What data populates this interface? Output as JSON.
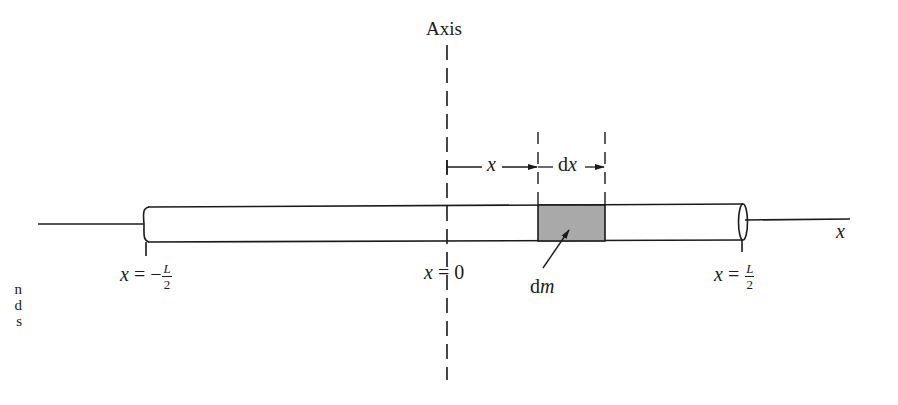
{
  "figure": {
    "axis_title": "Axis",
    "x_axis_label": "x",
    "dimension_labels": {
      "x": "x",
      "dx_d": "d",
      "dx_x": "x"
    },
    "endpoint_labels": {
      "left": {
        "var": "x",
        "eq": " = −",
        "num": "L",
        "den": "2"
      },
      "center": {
        "var": "x",
        "eq": " = 0"
      },
      "right": {
        "var": "x",
        "eq": " = ",
        "num": "L",
        "den": "2"
      }
    },
    "mass_element_label": {
      "d": "d",
      "m": "m"
    },
    "caption_fragments": [
      "n",
      "d",
      "s"
    ],
    "colors": {
      "ink": "#1a1a1a",
      "mass_element_fill": "#a9a9a9",
      "background": "#ffffff"
    }
  }
}
